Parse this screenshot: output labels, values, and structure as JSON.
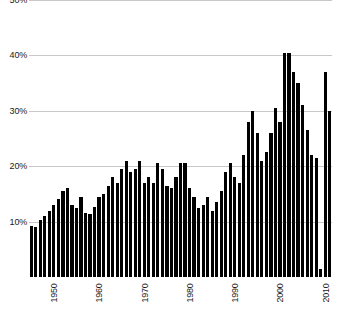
{
  "chart_data": {
    "type": "bar",
    "title": "",
    "subtitle": "",
    "xlabel": "",
    "ylabel": "",
    "grid": true,
    "legend": null,
    "bar_color": "#000000",
    "grid_color": "#c8c8c8",
    "xlim": [
      1944.5,
      2011.5
    ],
    "ylim": [
      0,
      50
    ],
    "y_tick_labels": [
      "50%",
      "40%",
      "30%",
      "20%",
      "10%"
    ],
    "y_tick_values": [
      50,
      40,
      30,
      20,
      10
    ],
    "x_tick_labels": [
      "1950",
      "1960",
      "1970",
      "1980",
      "1990",
      "2000",
      "2010"
    ],
    "x_tick_values": [
      1950,
      1960,
      1970,
      1980,
      1990,
      2000,
      2010
    ],
    "categories": [
      1945,
      1946,
      1947,
      1948,
      1949,
      1950,
      1951,
      1952,
      1953,
      1954,
      1955,
      1956,
      1957,
      1958,
      1959,
      1960,
      1961,
      1962,
      1963,
      1964,
      1965,
      1966,
      1967,
      1968,
      1969,
      1970,
      1971,
      1972,
      1973,
      1974,
      1975,
      1976,
      1977,
      1978,
      1979,
      1980,
      1981,
      1982,
      1983,
      1984,
      1985,
      1986,
      1987,
      1988,
      1989,
      1990,
      1991,
      1992,
      1993,
      1994,
      1995,
      1996,
      1997,
      1998,
      1999,
      2000,
      2001,
      2002,
      2003,
      2004,
      2005,
      2006,
      2007,
      2008,
      2009,
      2010,
      2011
    ],
    "values": [
      9.2,
      9.0,
      10.3,
      11.0,
      12.0,
      13.0,
      14.0,
      15.5,
      16.0,
      13.0,
      12.5,
      14.5,
      11.6,
      11.3,
      12.7,
      14.5,
      15.0,
      16.5,
      18.0,
      17.0,
      19.5,
      21.0,
      19.0,
      19.5,
      21.0,
      17.0,
      18.0,
      17.0,
      20.5,
      19.5,
      16.5,
      16.0,
      18.0,
      20.5,
      20.5,
      16.0,
      14.5,
      12.5,
      13.0,
      14.5,
      12.0,
      13.5,
      15.5,
      19.0,
      20.5,
      18.0,
      17.0,
      22.0,
      28.0,
      30.0,
      26.0,
      21.0,
      22.5,
      26.0,
      30.5,
      28.0,
      40.5,
      40.5,
      37.0,
      35.0,
      31.0,
      26.5,
      22.0,
      21.5,
      1.5,
      37.0,
      30.0
    ]
  }
}
